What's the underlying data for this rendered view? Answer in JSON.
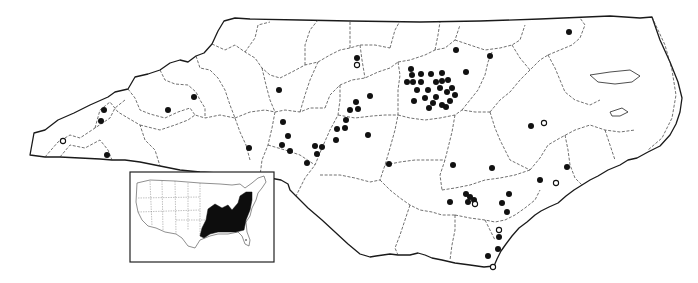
{
  "map": {
    "title": "North Carolina species distribution map",
    "region": "North Carolina",
    "legend": {
      "filled_dot": "recorded occurrence",
      "open_dot": "historical / questionable occurrence"
    },
    "colors": {
      "dot": "#111111",
      "range": "#0d0d0d",
      "outline": "#1a1a1a",
      "background": "#ffffff"
    },
    "occurrences": [
      {
        "x": 104,
        "y": 110,
        "type": "filled"
      },
      {
        "x": 101,
        "y": 121,
        "type": "filled"
      },
      {
        "x": 107,
        "y": 155,
        "type": "filled"
      },
      {
        "x": 63,
        "y": 141,
        "type": "open"
      },
      {
        "x": 168,
        "y": 110,
        "type": "filled"
      },
      {
        "x": 194,
        "y": 97,
        "type": "filled"
      },
      {
        "x": 249,
        "y": 148,
        "type": "filled"
      },
      {
        "x": 279,
        "y": 90,
        "type": "filled"
      },
      {
        "x": 283,
        "y": 122,
        "type": "filled"
      },
      {
        "x": 288,
        "y": 136,
        "type": "filled"
      },
      {
        "x": 282,
        "y": 145,
        "type": "filled"
      },
      {
        "x": 290,
        "y": 151,
        "type": "filled"
      },
      {
        "x": 317,
        "y": 154,
        "type": "filled"
      },
      {
        "x": 307,
        "y": 163,
        "type": "filled"
      },
      {
        "x": 357,
        "y": 58,
        "type": "filled"
      },
      {
        "x": 357,
        "y": 65,
        "type": "open"
      },
      {
        "x": 370,
        "y": 96,
        "type": "filled"
      },
      {
        "x": 350,
        "y": 110,
        "type": "filled"
      },
      {
        "x": 358,
        "y": 109,
        "type": "filled"
      },
      {
        "x": 346,
        "y": 120,
        "type": "filled"
      },
      {
        "x": 345,
        "y": 128,
        "type": "filled"
      },
      {
        "x": 337,
        "y": 129,
        "type": "filled"
      },
      {
        "x": 336,
        "y": 140,
        "type": "filled"
      },
      {
        "x": 322,
        "y": 147,
        "type": "filled"
      },
      {
        "x": 315,
        "y": 146,
        "type": "filled"
      },
      {
        "x": 368,
        "y": 135,
        "type": "filled"
      },
      {
        "x": 356,
        "y": 102,
        "type": "filled"
      },
      {
        "x": 456,
        "y": 50,
        "type": "filled"
      },
      {
        "x": 490,
        "y": 56,
        "type": "filled"
      },
      {
        "x": 442,
        "y": 73,
        "type": "filled"
      },
      {
        "x": 466,
        "y": 72,
        "type": "filled"
      },
      {
        "x": 411,
        "y": 69,
        "type": "filled"
      },
      {
        "x": 412,
        "y": 75,
        "type": "filled"
      },
      {
        "x": 421,
        "y": 74,
        "type": "filled"
      },
      {
        "x": 431,
        "y": 74,
        "type": "filled"
      },
      {
        "x": 407,
        "y": 82,
        "type": "filled"
      },
      {
        "x": 413,
        "y": 82,
        "type": "filled"
      },
      {
        "x": 421,
        "y": 82,
        "type": "filled"
      },
      {
        "x": 436,
        "y": 82,
        "type": "filled"
      },
      {
        "x": 442,
        "y": 81,
        "type": "filled"
      },
      {
        "x": 448,
        "y": 80,
        "type": "filled"
      },
      {
        "x": 417,
        "y": 90,
        "type": "filled"
      },
      {
        "x": 428,
        "y": 90,
        "type": "filled"
      },
      {
        "x": 440,
        "y": 88,
        "type": "filled"
      },
      {
        "x": 447,
        "y": 92,
        "type": "filled"
      },
      {
        "x": 452,
        "y": 88,
        "type": "filled"
      },
      {
        "x": 455,
        "y": 95,
        "type": "filled"
      },
      {
        "x": 425,
        "y": 98,
        "type": "filled"
      },
      {
        "x": 436,
        "y": 97,
        "type": "filled"
      },
      {
        "x": 450,
        "y": 101,
        "type": "filled"
      },
      {
        "x": 433,
        "y": 103,
        "type": "filled"
      },
      {
        "x": 446,
        "y": 107,
        "type": "filled"
      },
      {
        "x": 414,
        "y": 101,
        "type": "filled"
      },
      {
        "x": 429,
        "y": 108,
        "type": "filled"
      },
      {
        "x": 442,
        "y": 105,
        "type": "filled"
      },
      {
        "x": 569,
        "y": 32,
        "type": "filled"
      },
      {
        "x": 531,
        "y": 126,
        "type": "filled"
      },
      {
        "x": 544,
        "y": 123,
        "type": "open"
      },
      {
        "x": 389,
        "y": 164,
        "type": "filled"
      },
      {
        "x": 453,
        "y": 165,
        "type": "filled"
      },
      {
        "x": 492,
        "y": 168,
        "type": "filled"
      },
      {
        "x": 567,
        "y": 167,
        "type": "filled"
      },
      {
        "x": 466,
        "y": 194,
        "type": "filled"
      },
      {
        "x": 470,
        "y": 197,
        "type": "filled"
      },
      {
        "x": 474,
        "y": 200,
        "type": "filled"
      },
      {
        "x": 475,
        "y": 204,
        "type": "open"
      },
      {
        "x": 468,
        "y": 202,
        "type": "filled"
      },
      {
        "x": 450,
        "y": 202,
        "type": "filled"
      },
      {
        "x": 509,
        "y": 194,
        "type": "filled"
      },
      {
        "x": 502,
        "y": 203,
        "type": "filled"
      },
      {
        "x": 507,
        "y": 212,
        "type": "filled"
      },
      {
        "x": 540,
        "y": 180,
        "type": "filled"
      },
      {
        "x": 556,
        "y": 183,
        "type": "open"
      },
      {
        "x": 499,
        "y": 230,
        "type": "open"
      },
      {
        "x": 499,
        "y": 237,
        "type": "filled"
      },
      {
        "x": 498,
        "y": 249,
        "type": "filled"
      },
      {
        "x": 488,
        "y": 256,
        "type": "filled"
      },
      {
        "x": 493,
        "y": 267,
        "type": "open"
      }
    ]
  },
  "inset": {
    "title": "United States range inset",
    "range_description": "Eastern United States (shaded range)"
  }
}
